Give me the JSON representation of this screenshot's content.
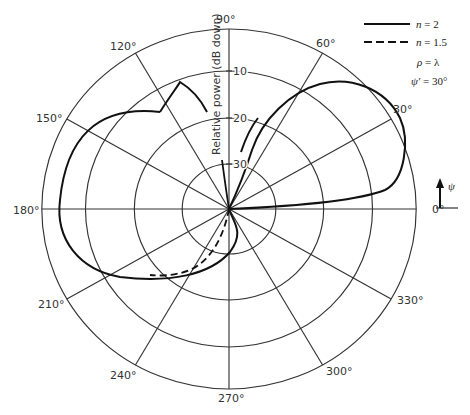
{
  "diagram": {
    "type": "polar radiation pattern",
    "angle_labels": [
      "0°",
      "30°",
      "60°",
      "90°",
      "120°",
      "150°",
      "180°",
      "210°",
      "240°",
      "270°",
      "300°",
      "330°"
    ],
    "radial_axis_label": "Relative power (dB down)",
    "radial_ticks": [
      "10",
      "20",
      "30"
    ],
    "legend": {
      "solid": {
        "var": "n",
        "eq": " = 2"
      },
      "dashed": {
        "var": "n",
        "eq": " = 1.5"
      },
      "rho": {
        "var": "ρ",
        "eq": " = λ"
      },
      "psi": {
        "var": "ψ′",
        "eq": " = 30°"
      }
    },
    "psi_arrow_label": "ψ",
    "colors": {
      "line": "#222222",
      "curve": "#111111",
      "text": "#333333"
    }
  }
}
